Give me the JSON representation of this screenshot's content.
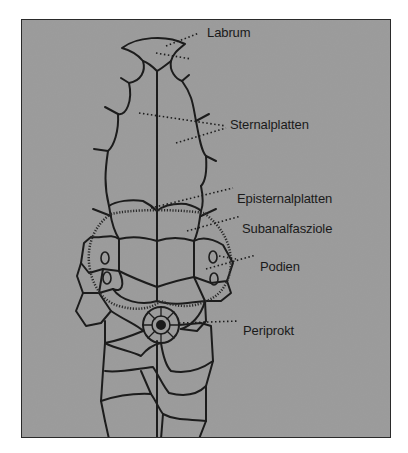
{
  "figure": {
    "labels": [
      {
        "id": "labrum",
        "text": "Labrum",
        "x": 206,
        "y": 24
      },
      {
        "id": "sternalplatten",
        "text": "Sternalplatten",
        "x": 229,
        "y": 100
      },
      {
        "id": "episternalplatten",
        "text": "Episternalplatten",
        "x": 236,
        "y": 181
      },
      {
        "id": "subanalfasziole",
        "text": "Subanalfasziole",
        "x": 242,
        "y": 210
      },
      {
        "id": "podien",
        "text": "Podien",
        "x": 260,
        "y": 249
      },
      {
        "id": "periprokt",
        "text": "Periprokt",
        "x": 243,
        "y": 313
      }
    ],
    "background_color": "#9a9a9a",
    "line_color": "#1c1c1c"
  }
}
